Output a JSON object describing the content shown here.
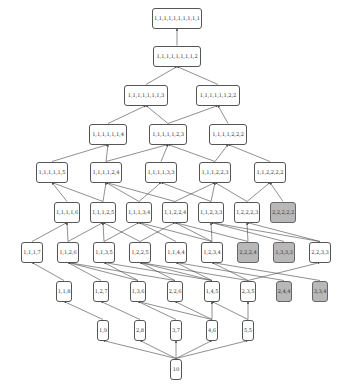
{
  "diagram": {
    "colors": {
      "node_fill": "#ffffff",
      "node_shaded_fill": "#b8b8b8",
      "border": "#555555",
      "edge": "#444444"
    },
    "levels": [
      {
        "y": 18,
        "nodes": [
          {
            "id": "n1",
            "label": "1,1,1,1,1,1,1,1,1,1",
            "x": 177,
            "w": 50
          }
        ]
      },
      {
        "y": 56,
        "nodes": [
          {
            "id": "n2",
            "label": "1,1,1,1,1,1,1,1,2",
            "x": 177,
            "w": 48
          }
        ]
      },
      {
        "y": 95,
        "nodes": [
          {
            "id": "n3a",
            "label": "1,1,1,1,1,1,1,3",
            "x": 146,
            "w": 44
          },
          {
            "id": "n3b",
            "label": "1,1,1,1,1,1,2,2",
            "x": 218,
            "w": 44
          }
        ]
      },
      {
        "y": 134,
        "nodes": [
          {
            "id": "n4a",
            "label": "1,1,1,1,1,1,4",
            "x": 108,
            "w": 38
          },
          {
            "id": "n4b",
            "label": "1,1,1,1,1,2,3",
            "x": 168,
            "w": 38
          },
          {
            "id": "n4c",
            "label": "1,1,1,1,2,2,2",
            "x": 228,
            "w": 38
          }
        ]
      },
      {
        "y": 172,
        "nodes": [
          {
            "id": "n5a",
            "label": "1,1,1,1,1,5",
            "x": 52,
            "w": 32
          },
          {
            "id": "n5b",
            "label": "1,1,1,1,2,4",
            "x": 106,
            "w": 32
          },
          {
            "id": "n5c",
            "label": "1,1,1,1,3,3",
            "x": 161,
            "w": 32
          },
          {
            "id": "n5d",
            "label": "1,1,1,2,2,3",
            "x": 215,
            "w": 32
          },
          {
            "id": "n5e",
            "label": "1,1,2,2,2,2",
            "x": 270,
            "w": 32
          }
        ]
      },
      {
        "y": 212,
        "nodes": [
          {
            "id": "n6a",
            "label": "1,1,1,1,6",
            "x": 67,
            "w": 26
          },
          {
            "id": "n6b",
            "label": "1,1,1,2,5",
            "x": 103,
            "w": 26
          },
          {
            "id": "n6c",
            "label": "1,1,1,3,4",
            "x": 139,
            "w": 26
          },
          {
            "id": "n6d",
            "label": "1,1,2,2,4",
            "x": 175,
            "w": 26
          },
          {
            "id": "n6e",
            "label": "1,1,2,3,3",
            "x": 211,
            "w": 26
          },
          {
            "id": "n6f",
            "label": "1,2,2,2,3",
            "x": 247,
            "w": 26
          },
          {
            "id": "n6g",
            "label": "2,2,2,2,2",
            "x": 283,
            "w": 26,
            "shaded": true
          }
        ]
      },
      {
        "y": 252,
        "nodes": [
          {
            "id": "n7a",
            "label": "1,1,1,7",
            "x": 32,
            "w": 22
          },
          {
            "id": "n7b",
            "label": "1,1,2,6",
            "x": 68,
            "w": 22
          },
          {
            "id": "n7c",
            "label": "1,1,3,5",
            "x": 104,
            "w": 22
          },
          {
            "id": "n7d",
            "label": "1,2,2,5",
            "x": 140,
            "w": 22
          },
          {
            "id": "n7e",
            "label": "1,1,4,4",
            "x": 176,
            "w": 22
          },
          {
            "id": "n7f",
            "label": "1,2,3,4",
            "x": 212,
            "w": 22
          },
          {
            "id": "n7g",
            "label": "2,2,2,4",
            "x": 248,
            "w": 22,
            "shaded": true
          },
          {
            "id": "n7h",
            "label": "1,3,3,3",
            "x": 284,
            "w": 22,
            "shaded": true
          },
          {
            "id": "n7i",
            "label": "2,2,3,3",
            "x": 320,
            "w": 22
          }
        ]
      },
      {
        "y": 291,
        "nodes": [
          {
            "id": "n8a",
            "label": "1,1,8",
            "x": 64,
            "w": 16
          },
          {
            "id": "n8b",
            "label": "1,2,7",
            "x": 101,
            "w": 16
          },
          {
            "id": "n8c",
            "label": "1,3,6",
            "x": 138,
            "w": 16
          },
          {
            "id": "n8d",
            "label": "2,2,6",
            "x": 175,
            "w": 16
          },
          {
            "id": "n8e",
            "label": "1,4,5",
            "x": 212,
            "w": 16
          },
          {
            "id": "n8f",
            "label": "2,3,5",
            "x": 248,
            "w": 16
          },
          {
            "id": "n8g",
            "label": "2,4,4",
            "x": 284,
            "w": 16,
            "shaded": true
          },
          {
            "id": "n8h",
            "label": "3,3,4",
            "x": 320,
            "w": 16,
            "shaded": true
          }
        ]
      },
      {
        "y": 330,
        "nodes": [
          {
            "id": "n9a",
            "label": "1,9",
            "x": 103,
            "w": 12
          },
          {
            "id": "n9b",
            "label": "2,8",
            "x": 140,
            "w": 12
          },
          {
            "id": "n9c",
            "label": "3,7",
            "x": 176,
            "w": 12
          },
          {
            "id": "n9d",
            "label": "4,6",
            "x": 212,
            "w": 12
          },
          {
            "id": "n9e",
            "label": "5,5",
            "x": 248,
            "w": 12
          }
        ]
      },
      {
        "y": 369,
        "nodes": [
          {
            "id": "n10",
            "label": "10",
            "x": 176,
            "w": 12
          }
        ]
      }
    ],
    "edges": [
      [
        "n2",
        "n1"
      ],
      [
        "n3a",
        "n2"
      ],
      [
        "n3b",
        "n2"
      ],
      [
        "n4a",
        "n3a"
      ],
      [
        "n4b",
        "n3a"
      ],
      [
        "n4b",
        "n3b"
      ],
      [
        "n4c",
        "n3b"
      ],
      [
        "n5a",
        "n4a"
      ],
      [
        "n5b",
        "n4a"
      ],
      [
        "n5b",
        "n4b"
      ],
      [
        "n5c",
        "n4b"
      ],
      [
        "n5d",
        "n4b"
      ],
      [
        "n5d",
        "n4c"
      ],
      [
        "n5e",
        "n4c"
      ],
      [
        "n6a",
        "n5a"
      ],
      [
        "n6b",
        "n5a"
      ],
      [
        "n6b",
        "n5b"
      ],
      [
        "n6c",
        "n5b"
      ],
      [
        "n6c",
        "n5c"
      ],
      [
        "n6d",
        "n5b"
      ],
      [
        "n6d",
        "n5d"
      ],
      [
        "n6e",
        "n5c"
      ],
      [
        "n6e",
        "n5d"
      ],
      [
        "n6f",
        "n5d"
      ],
      [
        "n6f",
        "n5e"
      ],
      [
        "n6g",
        "n5e"
      ],
      [
        "n7a",
        "n6a"
      ],
      [
        "n7b",
        "n6a"
      ],
      [
        "n7b",
        "n6b"
      ],
      [
        "n7c",
        "n6b"
      ],
      [
        "n7c",
        "n6c"
      ],
      [
        "n7d",
        "n6b"
      ],
      [
        "n7d",
        "n6d"
      ],
      [
        "n7e",
        "n6c"
      ],
      [
        "n7f",
        "n6c"
      ],
      [
        "n7f",
        "n6d"
      ],
      [
        "n7f",
        "n6e"
      ],
      [
        "n7g",
        "n6d"
      ],
      [
        "n7g",
        "n6f"
      ],
      [
        "n7h",
        "n6e"
      ],
      [
        "n7i",
        "n6e"
      ],
      [
        "n7i",
        "n6f"
      ],
      [
        "n8a",
        "n7a"
      ],
      [
        "n8b",
        "n7b"
      ],
      [
        "n8c",
        "n7b"
      ],
      [
        "n8c",
        "n7c"
      ],
      [
        "n8d",
        "n7b"
      ],
      [
        "n8d",
        "n7d"
      ],
      [
        "n8e",
        "n7c"
      ],
      [
        "n8e",
        "n7d"
      ],
      [
        "n8e",
        "n7e"
      ],
      [
        "n8f",
        "n7d"
      ],
      [
        "n8f",
        "n7f"
      ],
      [
        "n8f",
        "n7i"
      ],
      [
        "n8g",
        "n7e"
      ],
      [
        "n8h",
        "n7f"
      ],
      [
        "n9a",
        "n8a"
      ],
      [
        "n9b",
        "n8b"
      ],
      [
        "n9c",
        "n8c"
      ],
      [
        "n9d",
        "n8c"
      ],
      [
        "n9d",
        "n8d"
      ],
      [
        "n9d",
        "n8e"
      ],
      [
        "n9e",
        "n8e"
      ],
      [
        "n9e",
        "n8f"
      ],
      [
        "n10",
        "n9a"
      ],
      [
        "n10",
        "n9b"
      ],
      [
        "n10",
        "n9c"
      ],
      [
        "n10",
        "n9d"
      ],
      [
        "n10",
        "n9e"
      ]
    ]
  }
}
